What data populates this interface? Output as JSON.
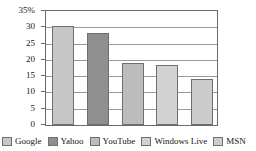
{
  "chart_data": {
    "type": "bar",
    "title": "",
    "subtitle": "",
    "xlabel": "",
    "ylabel": "",
    "categories": [
      "Google",
      "Yahoo",
      "YouTube",
      "Windows Live",
      "MSN"
    ],
    "values": [
      30.5,
      28.3,
      18.9,
      18.5,
      14.2
    ],
    "ylim": [
      0,
      35
    ],
    "ytick_labels": [
      "35%",
      "30",
      "25",
      "20",
      "15",
      "10",
      "5",
      "0"
    ],
    "ytick_values": [
      35,
      30,
      25,
      20,
      15,
      10,
      5,
      0
    ],
    "grid": true,
    "legend_position": "bottom",
    "legend": [
      {
        "label": "Google",
        "color": "#c6c6c6"
      },
      {
        "label": "Yahoo",
        "color": "#8f8f8f"
      },
      {
        "label": "YouTube",
        "color": "#bcbcbc"
      },
      {
        "label": "Windows Live",
        "color": "#d2d2d2"
      },
      {
        "label": "MSN",
        "color": "#cccccc"
      }
    ],
    "series": [
      {
        "name": "Market share",
        "values": [
          30.5,
          28.3,
          18.9,
          18.5,
          14.2
        ]
      }
    ],
    "bars": [
      {
        "label": "Google",
        "value": 30.5,
        "color": "#c6c6c6"
      },
      {
        "label": "Yahoo",
        "value": 28.3,
        "color": "#8f8f8f"
      },
      {
        "label": "YouTube",
        "value": 18.9,
        "color": "#bcbcbc"
      },
      {
        "label": "Windows Live",
        "value": 18.5,
        "color": "#d2d2d2"
      },
      {
        "label": "MSN",
        "value": 14.2,
        "color": "#cccccc"
      }
    ],
    "axis_color": "#6b6b6b",
    "gridline_color": "#9a9a9a",
    "background": "#ffffff"
  }
}
